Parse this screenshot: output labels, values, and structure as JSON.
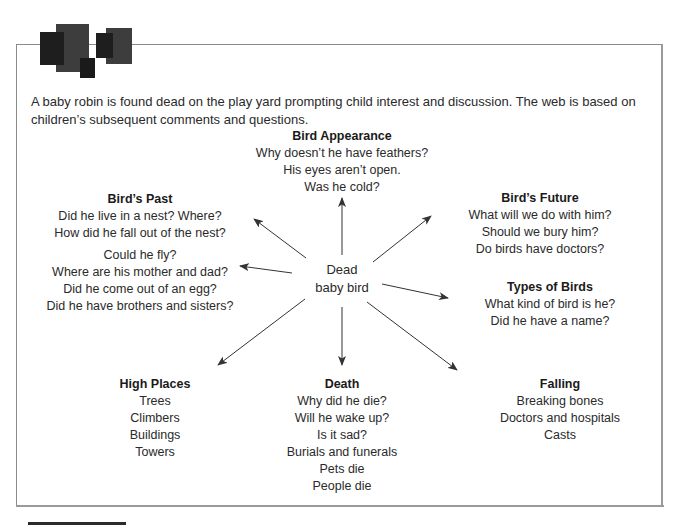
{
  "intro": {
    "text": "A baby robin is found dead on the play yard prompting child interest and discussion. The web is based on children’s subsequent comments and questions."
  },
  "center": {
    "line1": "Dead",
    "line2": "baby bird"
  },
  "nodes": {
    "bird_appearance": {
      "title": "Bird Appearance",
      "items": [
        "Why doesn’t he have feathers?",
        "His eyes aren’t open.",
        "Was he cold?"
      ]
    },
    "birds_past": {
      "title": "Bird’s Past",
      "items": [
        "Did he live in a nest? Where?",
        "How did he fall out of the nest?"
      ],
      "items2": [
        "Could he fly?",
        "Where are his mother and dad?",
        "Did he come out of an egg?",
        "Did he have brothers and sisters?"
      ]
    },
    "birds_future": {
      "title": "Bird’s Future",
      "items": [
        "What will we do with him?",
        "Should we bury him?",
        "Do birds have doctors?"
      ]
    },
    "types_of_birds": {
      "title": "Types of Birds",
      "items": [
        "What kind of bird is he?",
        "Did he have a name?"
      ]
    },
    "high_places": {
      "title": "High Places",
      "items": [
        "Trees",
        "Climbers",
        "Buildings",
        "Towers"
      ]
    },
    "death": {
      "title": "Death",
      "items": [
        "Why did he die?",
        "Will he wake up?",
        "Is it sad?",
        "Burials and funerals",
        "Pets die",
        "People die"
      ]
    },
    "falling": {
      "title": "Falling",
      "items": [
        "Breaking bones",
        "Doctors and hospitals",
        "Casts"
      ]
    }
  },
  "colors": {
    "dark_square": "#1e1e1e",
    "mid_square": "#3d3d3d",
    "frame": "#8a8a8a",
    "arrow": "#333333"
  }
}
